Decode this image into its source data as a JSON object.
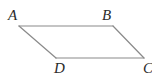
{
  "figure": {
    "name": "parallelogram-ABCD",
    "shape_type": "parallelogram",
    "background_color": "#ffffff",
    "stroke_color": "#8a8a8a",
    "stroke_width": 1.2,
    "fill": "none",
    "label_color": "#2b2b2b",
    "label_style": "italic-serif",
    "vertices": [
      {
        "id": "A",
        "label": "A",
        "x": 19,
        "y": 26,
        "label_x": 8,
        "label_y": 8,
        "label_position": "above-left"
      },
      {
        "id": "B",
        "label": "B",
        "x": 113,
        "y": 26,
        "label_x": 102,
        "label_y": 8,
        "label_position": "above-left"
      },
      {
        "id": "C",
        "label": "C",
        "x": 144,
        "y": 58,
        "label_x": 143,
        "label_y": 61,
        "label_position": "below-right",
        "clipped": "true"
      },
      {
        "id": "D",
        "label": "D",
        "x": 56,
        "y": 58,
        "label_x": 54,
        "label_y": 61,
        "label_position": "below-left"
      }
    ],
    "edges": [
      {
        "id": "AB",
        "label": "AB",
        "from": "A",
        "to": "B",
        "x1": 19,
        "y1": 26,
        "x2": 113,
        "y2": 26
      },
      {
        "id": "BC",
        "label": "BC",
        "from": "B",
        "to": "C",
        "x1": 113,
        "y1": 26,
        "x2": 144,
        "y2": 58
      },
      {
        "id": "CD",
        "label": "CD",
        "from": "C",
        "to": "D",
        "x1": 144,
        "y1": 58,
        "x2": 56,
        "y2": 58
      },
      {
        "id": "DA",
        "label": "DA",
        "from": "D",
        "to": "A",
        "x1": 56,
        "y1": 58,
        "x2": 19,
        "y2": 26
      }
    ]
  },
  "canvas": {
    "width": 152,
    "height": 82
  }
}
